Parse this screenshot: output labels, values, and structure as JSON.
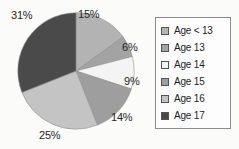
{
  "chart_data": {
    "type": "pie",
    "title": "",
    "categories": [
      "Age < 13",
      "Age 13",
      "Age 14",
      "Age 15",
      "Age 16",
      "Age 17"
    ],
    "values": [
      15,
      6,
      9,
      14,
      25,
      31
    ],
    "value_labels": [
      "15%",
      "6%",
      "9%",
      "14%",
      "25%",
      "31%"
    ],
    "units": "percent",
    "start_angle_deg": 0,
    "direction": "clockwise",
    "colors": [
      "#b3b3b3",
      "#a3a3a3",
      "#f4f4f4",
      "#9e9e9e",
      "#c4c4c4",
      "#4a4a4a"
    ],
    "legend": {
      "position": "right",
      "border_color": "#8c8c8c",
      "entries": [
        {
          "label": "Age < 13",
          "color": "#b3b3b3",
          "value_label": "15%"
        },
        {
          "label": "Age 13",
          "color": "#a3a3a3",
          "value_label": "6%"
        },
        {
          "label": "Age 14",
          "color": "#f4f4f4",
          "value_label": "9%"
        },
        {
          "label": "Age 15",
          "color": "#9e9e9e",
          "value_label": "14%"
        },
        {
          "label": "Age 16",
          "color": "#c4c4c4",
          "value_label": "25%"
        },
        {
          "label": "Age 17",
          "color": "#4a4a4a",
          "value_label": "31%"
        }
      ]
    },
    "background_color": "#fbfbfa",
    "grid": false
  }
}
